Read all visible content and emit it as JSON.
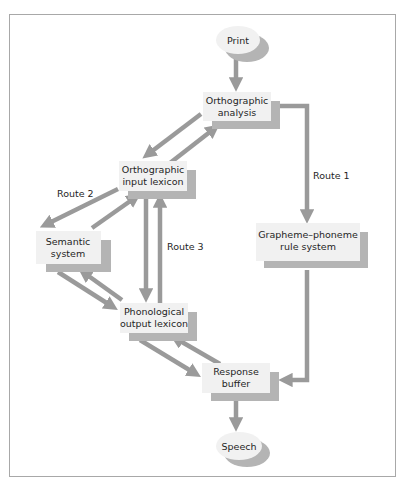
{
  "colors": {
    "arrow": "#9a9a9a",
    "box_fill": "#f1f1f1",
    "shadow": "#b4b4b4",
    "frame": "#a8a8a8"
  },
  "nodes": {
    "print": {
      "label": "Print"
    },
    "orthographic_analysis": {
      "line1": "Orthographic",
      "line2": "analysis"
    },
    "orthographic_input_lexicon": {
      "line1": "Orthographic",
      "line2": "input lexicon"
    },
    "semantic_system": {
      "line1": "Semantic",
      "line2": "system"
    },
    "phonological_output_lexicon": {
      "line1": "Phonological",
      "line2": "output lexicon"
    },
    "grapheme_phoneme": {
      "line1": "Grapheme–phoneme",
      "line2": "rule system"
    },
    "response_buffer": {
      "line1": "Response",
      "line2": "buffer"
    },
    "speech": {
      "label": "Speech"
    }
  },
  "routes": {
    "route1": "Route 1",
    "route2": "Route 2",
    "route3": "Route 3"
  }
}
